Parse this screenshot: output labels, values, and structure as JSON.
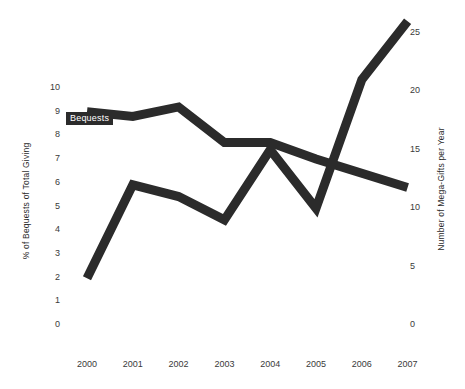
{
  "chart_data": {
    "type": "line",
    "title": "",
    "xlabel": "",
    "categories": [
      "2000",
      "2001",
      "2002",
      "2003",
      "2004",
      "2005",
      "2006",
      "2007"
    ],
    "grid": false,
    "legend_position": "inline-labels",
    "axes": {
      "left": {
        "label": "% of Bequests of Total Giving",
        "ticks": [
          "10",
          "9",
          "8",
          "7",
          "6",
          "5",
          "4",
          "3",
          "2",
          "1",
          "0"
        ],
        "tick_values": [
          10,
          9,
          8,
          7,
          6,
          5,
          4,
          3,
          2,
          1,
          0
        ],
        "ylim": [
          0,
          10
        ]
      },
      "right": {
        "label": "Number of Mega-Gifts per Year",
        "ticks": [
          "25",
          "20",
          "15",
          "10",
          "5",
          "0"
        ],
        "tick_values": [
          25,
          20,
          15,
          10,
          5,
          0
        ],
        "ylim": [
          0,
          27.5
        ]
      }
    },
    "series": [
      {
        "name": "Bequests",
        "axis": "left",
        "color": "#2b2b2b",
        "values": [
          9.0,
          8.8,
          9.2,
          7.7,
          7.7,
          7.0,
          6.4,
          5.8
        ]
      },
      {
        "name": "Mega-Gifts",
        "axis": "right",
        "color": "#2b2b2b",
        "values": [
          4,
          12,
          11,
          9,
          15,
          10,
          21,
          26
        ]
      }
    ]
  },
  "labels": {
    "bequests_tag": "Bequests",
    "megagifts_tag": "Mega-Gifts"
  }
}
